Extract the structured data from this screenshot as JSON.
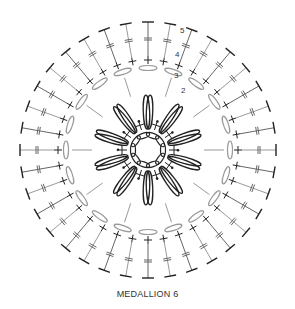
{
  "title": "MEDALLION 6",
  "round_labels": [
    "2",
    "3",
    "4",
    "5"
  ],
  "center": [
    148,
    150
  ],
  "outer_spokes": 36,
  "petals": 10,
  "colors": {
    "dark": "#222222",
    "mid": "#666666",
    "light": "#9a9a9a"
  }
}
